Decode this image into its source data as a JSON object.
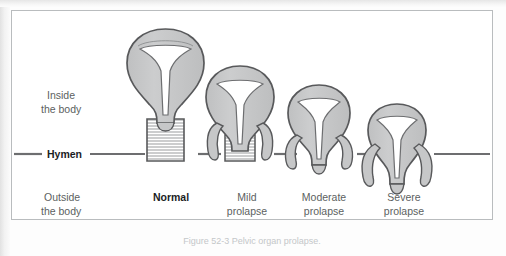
{
  "figure": {
    "title_caption": "Figure 52-3  Pelvic organ prolapse.",
    "hymen_label": "Hymen",
    "region_labels": {
      "inside_line1": "Inside",
      "inside_line2": "the body",
      "outside_line1": "Outside",
      "outside_line2": "the body"
    },
    "colors": {
      "organ_fill": "#c6c7c8",
      "organ_outline": "#58595b",
      "cavity_fill": "#ffffff",
      "hymen_line": "#6d6e70",
      "frame_border": "#b9bcbe",
      "background": "#ffffff",
      "label_gray": "#5c5f61",
      "label_dark": "#1b1d1f"
    },
    "stages": [
      {
        "key": "normal",
        "label_line1": "Normal",
        "label_line2": "",
        "emphasis": "bold",
        "descent_level": 0,
        "has_vaginal_canal": true,
        "canal_hatched": true,
        "center_x": 160,
        "uterus_top_y": 28
      },
      {
        "key": "mild",
        "label_line1": "Mild",
        "label_line2": "prolapse",
        "emphasis": "normal",
        "descent_level": 1,
        "has_vaginal_canal": true,
        "canal_hatched": true,
        "center_x": 235,
        "uterus_top_y": 65
      },
      {
        "key": "moderate",
        "label_line1": "Moderate",
        "label_line2": "prolapse",
        "emphasis": "normal",
        "descent_level": 2,
        "has_vaginal_canal": false,
        "canal_hatched": false,
        "center_x": 315,
        "uterus_top_y": 84
      },
      {
        "key": "severe",
        "label_line1": "Severe",
        "label_line2": "prolapse",
        "emphasis": "normal",
        "descent_level": 3,
        "has_vaginal_canal": false,
        "canal_hatched": false,
        "center_x": 394,
        "uterus_top_y": 103
      }
    ],
    "hymen_line_y": 153
  }
}
